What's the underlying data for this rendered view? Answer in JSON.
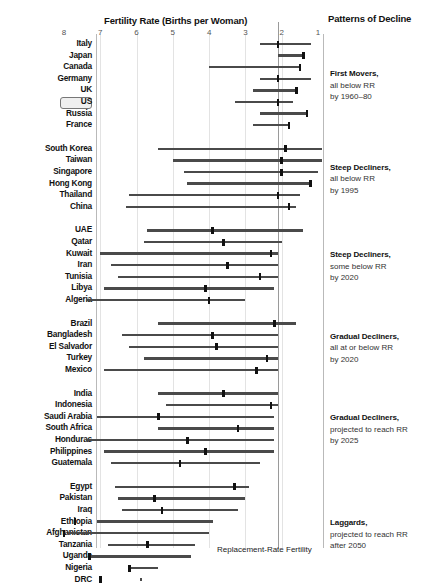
{
  "chart_title": "Fertility Rate (Births per Woman)",
  "patterns_title": "Patterns of Decline",
  "rr_caption": "Replacement-Rate Fertility",
  "highlight_country": "US",
  "colors": {
    "bar": "#4a4a4a",
    "marker": "#111111",
    "grid": "#e3e3e3",
    "rr_line": "#9a9a9a",
    "frame": "#b9b9b9"
  },
  "chart_data": {
    "type": "bar",
    "title": "Fertility Rate (Births per Woman)",
    "xlabel": "Fertility Rate (Births per Woman)",
    "ylabel": "",
    "xlim": [
      8,
      1
    ],
    "x_reversed": true,
    "ticks": [
      8,
      7,
      6,
      5,
      4,
      3,
      2,
      1
    ],
    "tick_labels": [
      "8",
      "7",
      "6",
      "5",
      "4",
      "3",
      "2",
      "1"
    ],
    "grid": true,
    "reference_line": {
      "value": 2.1,
      "label": "Replacement-Rate Fertility"
    },
    "legend_position": "right",
    "series_note": "Each row is a country range bar from historic high fertility (left) to latest/projected fertility (right); tick marker shows current rate.",
    "groups": [
      {
        "name": "First Movers,",
        "sub1": "all below RR",
        "sub2": "by 1960–80",
        "countries": [
          {
            "label": "Italy",
            "high": 2.6,
            "low": 1.2,
            "marker": 2.1
          },
          {
            "label": "Japan",
            "high": 2.1,
            "low": 1.4,
            "marker": 1.4
          },
          {
            "label": "Canada",
            "high": 4.0,
            "low": 1.5,
            "marker": 1.5
          },
          {
            "label": "Germany",
            "high": 2.6,
            "low": 1.2,
            "marker": 2.1
          },
          {
            "label": "UK",
            "high": 2.8,
            "low": 1.6,
            "marker": 1.6
          },
          {
            "label": "US",
            "high": 3.3,
            "low": 1.7,
            "marker": 2.1
          },
          {
            "label": "Russia",
            "high": 2.6,
            "low": 1.3,
            "marker": 1.3
          },
          {
            "label": "France",
            "high": 2.8,
            "low": 1.8,
            "marker": 1.8
          }
        ]
      },
      {
        "name": "Steep Decliners,",
        "sub1": "all below RR",
        "sub2": "by 1995",
        "countries": [
          {
            "label": "South Korea",
            "high": 5.4,
            "low": 0.9,
            "marker": 1.9
          },
          {
            "label": "Taiwan",
            "high": 5.0,
            "low": 0.9,
            "marker": 2.0
          },
          {
            "label": "Singapore",
            "high": 4.7,
            "low": 1.0,
            "marker": 2.0
          },
          {
            "label": "Hong Kong",
            "high": 4.6,
            "low": 1.2,
            "marker": 1.2
          },
          {
            "label": "Thailand",
            "high": 6.2,
            "low": 1.5,
            "marker": 2.1
          },
          {
            "label": "China",
            "high": 6.3,
            "low": 1.6,
            "marker": 1.8
          }
        ]
      },
      {
        "name": "Steep Decliners,",
        "sub1": "some below RR",
        "sub2": "by 2020",
        "countries": [
          {
            "label": "UAE",
            "high": 5.7,
            "low": 1.4,
            "marker": 3.9
          },
          {
            "label": "Qatar",
            "high": 5.8,
            "low": 2.0,
            "marker": 3.6
          },
          {
            "label": "Kuwait",
            "high": 7.0,
            "low": 2.1,
            "marker": 2.3
          },
          {
            "label": "Iran",
            "high": 6.7,
            "low": 2.1,
            "marker": 3.5
          },
          {
            "label": "Tunisia",
            "high": 6.5,
            "low": 2.1,
            "marker": 2.6
          },
          {
            "label": "Libya",
            "high": 6.9,
            "low": 2.2,
            "marker": 4.1
          },
          {
            "label": "Algeria",
            "high": 7.4,
            "low": 3.0,
            "marker": 4.0
          }
        ]
      },
      {
        "name": "Gradual Decliners,",
        "sub1": "all at or below RR",
        "sub2": "by 2020",
        "countries": [
          {
            "label": "Brazil",
            "high": 5.4,
            "low": 1.6,
            "marker": 2.2
          },
          {
            "label": "Bangladesh",
            "high": 6.4,
            "low": 2.1,
            "marker": 3.9
          },
          {
            "label": "El Salvador",
            "high": 6.2,
            "low": 2.1,
            "marker": 3.8
          },
          {
            "label": "Turkey",
            "high": 5.8,
            "low": 2.1,
            "marker": 2.4
          },
          {
            "label": "Mexico",
            "high": 6.9,
            "low": 2.1,
            "marker": 2.7
          }
        ]
      },
      {
        "name": "Gradual Decliners,",
        "sub1": "projected to reach RR",
        "sub2": "by 2025",
        "countries": [
          {
            "label": "India",
            "high": 5.4,
            "low": 2.1,
            "marker": 3.6
          },
          {
            "label": "Indonesia",
            "high": 5.2,
            "low": 2.1,
            "marker": 2.3
          },
          {
            "label": "Saudi Arabia",
            "high": 7.1,
            "low": 2.2,
            "marker": 5.4
          },
          {
            "label": "South Africa",
            "high": 5.4,
            "low": 2.2,
            "marker": 3.2
          },
          {
            "label": "Honduras",
            "high": 7.4,
            "low": 2.2,
            "marker": 4.6
          },
          {
            "label": "Philippines",
            "high": 6.9,
            "low": 2.2,
            "marker": 4.1
          },
          {
            "label": "Guatemala",
            "high": 6.7,
            "low": 2.6,
            "marker": 4.8
          }
        ]
      },
      {
        "name": "Laggards,",
        "sub1": "projected to reach RR",
        "sub2": "after 2050",
        "countries": [
          {
            "label": "Egypt",
            "high": 6.6,
            "low": 2.9,
            "marker": 3.3
          },
          {
            "label": "Pakistan",
            "high": 6.5,
            "low": 3.0,
            "marker": 5.5
          },
          {
            "label": "Iraq",
            "high": 6.4,
            "low": 3.2,
            "marker": 5.3
          },
          {
            "label": "Ethiopia",
            "high": 7.1,
            "low": 3.9,
            "marker": 7.7
          },
          {
            "label": "Afghanistan",
            "high": 7.9,
            "low": 4.0,
            "marker": 8.0
          },
          {
            "label": "Tanzania",
            "high": 6.8,
            "low": 4.4,
            "marker": 5.7
          },
          {
            "label": "Uganda",
            "high": 7.3,
            "low": 4.5,
            "marker": 7.3
          },
          {
            "label": "Nigeria",
            "high": 6.2,
            "low": 5.4,
            "marker": 6.2
          },
          {
            "label": "DRC",
            "high": 5.9,
            "low": 5.9,
            "marker": 7.0
          }
        ]
      }
    ]
  }
}
